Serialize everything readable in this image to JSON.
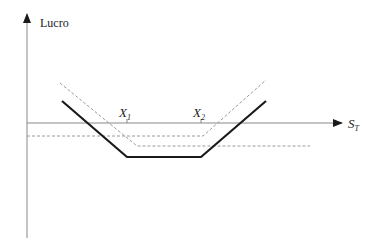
{
  "diagram": {
    "y_axis_label": "Lucro",
    "x_axis_label_main": "S",
    "x_axis_label_sub": "T",
    "strike_1_main": "X",
    "strike_1_sub": "1",
    "strike_2_main": "X",
    "strike_2_sub": "2",
    "colors": {
      "axis": "#888888",
      "payoff": "#1a1a1a",
      "dashed": "#9a9a9a",
      "text": "#222222"
    },
    "payoff_profile": {
      "description": "Strangle-style payoff: solid V with flat bottom between X1 and X2; two dashed component payoffs",
      "solid_points": [
        [
          62,
          101
        ],
        [
          127,
          157
        ],
        [
          201,
          157
        ],
        [
          266,
          101
        ]
      ],
      "dashed_left_leg_points": [
        [
          60,
          83
        ],
        [
          137,
          146
        ],
        [
          310,
          146
        ]
      ],
      "dashed_right_leg_points": [
        [
          27,
          136
        ],
        [
          203,
          136
        ],
        [
          266,
          80
        ]
      ]
    }
  }
}
